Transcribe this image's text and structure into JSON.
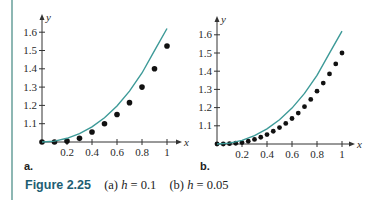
{
  "caption": {
    "figure_number": "Figure 2.25",
    "part_a_prefix": "(a) ",
    "part_a_var": "h",
    "part_a_eq": " = 0.1",
    "part_b_prefix": "(b) ",
    "part_b_var": "h",
    "part_b_eq": " = 0.05"
  },
  "panels": {
    "a": {
      "label": "a."
    },
    "b": {
      "label": "b."
    }
  },
  "colors": {
    "curve": "#3d9a98",
    "dots": "#111111",
    "axes": "#333333",
    "left_rule": "#8db7b3",
    "caption_title": "#1d5e73"
  },
  "chart_data": [
    {
      "type": "scatter",
      "title": "a.",
      "subtitle": "h = 0.1",
      "xlabel": "x",
      "ylabel": "y",
      "xlim": [
        0,
        1.05
      ],
      "ylim": [
        1.0,
        1.65
      ],
      "x_ticks": [
        0.2,
        0.4,
        0.6,
        0.8,
        1
      ],
      "x_tick_labels": [
        "0.2",
        "0.4",
        "0.6",
        "0.8",
        "1"
      ],
      "y_ticks": [
        1.1,
        1.2,
        1.3,
        1.4,
        1.5,
        1.6
      ],
      "y_tick_labels": [
        "1.1",
        "1.2",
        "1.3",
        "1.4",
        "1.5",
        "1.6"
      ],
      "grid": false,
      "legend": null,
      "series": [
        {
          "name": "approximation (dots)",
          "kind": "scatter",
          "x": [
            0,
            0.1,
            0.2,
            0.3,
            0.4,
            0.5,
            0.6,
            0.7,
            0.8,
            0.9,
            1.0
          ],
          "y": [
            1.0,
            1.0,
            1.005,
            1.02,
            1.055,
            1.1,
            1.15,
            1.215,
            1.3,
            1.4,
            1.525
          ]
        },
        {
          "name": "exact solution (curve)",
          "kind": "line",
          "x": [
            0,
            0.1,
            0.2,
            0.3,
            0.4,
            0.5,
            0.6,
            0.7,
            0.8,
            0.9,
            1.0
          ],
          "y": [
            1.0,
            1.005,
            1.02,
            1.046,
            1.083,
            1.133,
            1.197,
            1.278,
            1.377,
            1.499,
            1.62
          ]
        }
      ]
    },
    {
      "type": "scatter",
      "title": "b.",
      "subtitle": "h = 0.05",
      "xlabel": "x",
      "ylabel": "y",
      "xlim": [
        0,
        1.05
      ],
      "ylim": [
        1.0,
        1.65
      ],
      "x_ticks": [
        0.2,
        0.4,
        0.6,
        0.8,
        1
      ],
      "x_tick_labels": [
        "0.2",
        "0.4",
        "0.6",
        "0.8",
        "1"
      ],
      "y_ticks": [
        1.1,
        1.2,
        1.3,
        1.4,
        1.5,
        1.6
      ],
      "y_tick_labels": [
        "1.1",
        "1.2",
        "1.3",
        "1.4",
        "1.5",
        "1.6"
      ],
      "grid": false,
      "legend": null,
      "series": [
        {
          "name": "approximation (dots)",
          "kind": "scatter",
          "x": [
            0,
            0.05,
            0.1,
            0.15,
            0.2,
            0.25,
            0.3,
            0.35,
            0.4,
            0.45,
            0.5,
            0.55,
            0.6,
            0.65,
            0.7,
            0.75,
            0.8,
            0.85,
            0.9,
            0.95,
            1.0
          ],
          "y": [
            1.0,
            1.0,
            1.002,
            1.004,
            1.008,
            1.015,
            1.025,
            1.037,
            1.052,
            1.07,
            1.09,
            1.113,
            1.14,
            1.17,
            1.205,
            1.245,
            1.29,
            1.335,
            1.385,
            1.44,
            1.5
          ]
        },
        {
          "name": "exact solution (curve)",
          "kind": "line",
          "x": [
            0,
            0.1,
            0.2,
            0.3,
            0.4,
            0.5,
            0.6,
            0.7,
            0.8,
            0.9,
            1.0
          ],
          "y": [
            1.0,
            1.005,
            1.02,
            1.046,
            1.083,
            1.133,
            1.197,
            1.278,
            1.377,
            1.499,
            1.62
          ]
        }
      ]
    }
  ]
}
